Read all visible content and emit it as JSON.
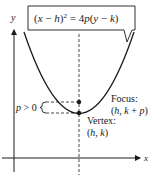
{
  "diagram": {
    "equation": {
      "open": "(",
      "x": "x",
      "minus1": " − ",
      "h": "h",
      "close_sq": ")",
      "exp": "2",
      "equals": " = 4",
      "p": "p",
      "paren_open": "(",
      "y": "y",
      "minus2": " − ",
      "k": "k",
      "paren_close": ")"
    },
    "axes": {
      "x_label": "x",
      "y_label": "y"
    },
    "focus": {
      "title": "Focus:",
      "coords_open": "(",
      "h": "h",
      "comma": ", ",
      "k": "k",
      "plus": " + ",
      "p": "p",
      "coords_close": ")"
    },
    "vertex": {
      "title": "Vertex:",
      "coords_open": "(",
      "h": "h",
      "comma": ", ",
      "k": "k",
      "coords_close": ")"
    },
    "p_label": {
      "p": "p",
      "rest": " > 0"
    },
    "colors": {
      "stroke": "#1a1a1a",
      "background": "#ffffff"
    }
  }
}
